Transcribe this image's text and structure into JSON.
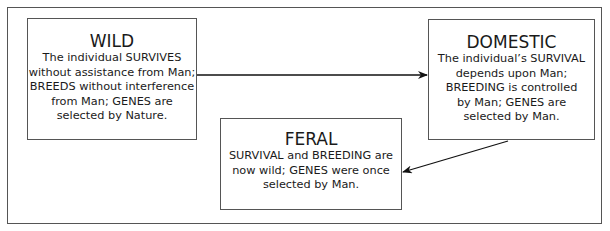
{
  "diagram": {
    "nodes": [
      {
        "id": "wild",
        "title": "WILD",
        "lines": [
          "The individual SURVIVES",
          "without assistance from Man;",
          "BREEDS without interference",
          "from Man; GENES are",
          "selected by Nature."
        ]
      },
      {
        "id": "domestic",
        "title": "DOMESTIC",
        "lines": [
          "The individual’s SURVIVAL",
          "depends upon Man;",
          "BREEDING is controlled",
          "by Man; GENES are",
          "selected by Man."
        ]
      },
      {
        "id": "feral",
        "title": "FERAL",
        "lines": [
          "SURVIVAL and BREEDING are",
          "now wild; GENES were once",
          "selected by Man."
        ]
      }
    ],
    "edges": [
      {
        "from": "wild",
        "to": "domestic"
      },
      {
        "from": "domestic",
        "to": "feral"
      }
    ],
    "colors": {
      "border": "#555555",
      "text": "#1a1a1a",
      "arrow": "#111111",
      "background": "#ffffff"
    }
  }
}
